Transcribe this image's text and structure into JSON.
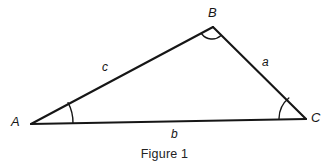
{
  "figure": {
    "caption": "Figure 1",
    "background_color": "#ffffff",
    "stroke_color": "#161616",
    "type": "geometry-diagram",
    "shape": "triangle",
    "vertices": [
      {
        "id": "A",
        "label": "A",
        "x": 31,
        "y": 124,
        "label_x": 11,
        "label_y": 115,
        "angle_arc_radius": 42
      },
      {
        "id": "B",
        "label": "B",
        "x": 213,
        "y": 27,
        "label_x": 208,
        "label_y": 6,
        "angle_arc_radius": 13
      },
      {
        "id": "C",
        "label": "C",
        "x": 306,
        "y": 119,
        "label_x": 311,
        "label_y": 111,
        "angle_arc_radius": 27
      }
    ],
    "sides": [
      {
        "id": "a",
        "label": "a",
        "between": "B-C",
        "label_x": 262,
        "label_y": 56
      },
      {
        "id": "b",
        "label": "b",
        "between": "A-C",
        "label_x": 171,
        "label_y": 128
      },
      {
        "id": "c",
        "label": "c",
        "between": "A-B",
        "label_x": 102,
        "label_y": 61
      }
    ]
  }
}
